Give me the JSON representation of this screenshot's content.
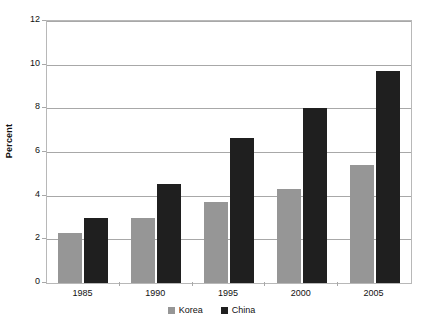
{
  "chart_data": {
    "type": "bar",
    "title": "",
    "subtitle": "",
    "xlabel": "",
    "ylabel": "Percent",
    "categories": [
      "1985",
      "1990",
      "1995",
      "2000",
      "2005"
    ],
    "series": [
      {
        "name": "Korea",
        "color": "#969696",
        "values": [
          2.3,
          3.0,
          3.7,
          4.3,
          5.4
        ]
      },
      {
        "name": "China",
        "color": "#1f1f1f",
        "values": [
          3.0,
          4.55,
          6.65,
          8.0,
          9.7
        ]
      }
    ],
    "ylim": [
      0,
      12
    ],
    "yticks": [
      0,
      2,
      4,
      6,
      8,
      10,
      12
    ],
    "ytick_labels": [
      "0",
      "2",
      "4",
      "6",
      "8",
      "10",
      "12"
    ],
    "grid": "horizontal",
    "legend_position": "bottom-center",
    "plot_border": true,
    "annotations": []
  },
  "legend": {
    "items": [
      {
        "label": "Korea",
        "color": "#969696"
      },
      {
        "label": "China",
        "color": "#1f1f1f"
      }
    ]
  },
  "axes": {
    "y_title": "Percent"
  },
  "colors": {
    "korea": "#969696",
    "china": "#1f1f1f",
    "gridline": "#a8a8a8",
    "border": "#b8b8b8",
    "text": "#111111",
    "background": "#ffffff"
  }
}
